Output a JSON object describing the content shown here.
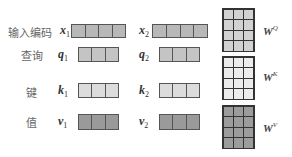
{
  "rows": [
    {
      "id": "input",
      "label": "输入编码",
      "var1": "x",
      "sub1": "1",
      "var2": "x",
      "sub2": "2",
      "cells": 4,
      "color": "#b8b8b8"
    },
    {
      "id": "query",
      "label": "查询",
      "var1": "q",
      "sub1": "1",
      "var2": "q",
      "sub2": "2",
      "cells": 3,
      "color": "#c4c4c4"
    },
    {
      "id": "key",
      "label": "键",
      "var1": "k",
      "sub1": "1",
      "var2": "k",
      "sub2": "2",
      "cells": 3,
      "color": "#dcdcdc"
    },
    {
      "id": "value",
      "label": "值",
      "var1": "v",
      "sub1": "1",
      "var2": "v",
      "sub2": "2",
      "cells": 3,
      "color": "#9a9a9a"
    }
  ],
  "matrices": [
    {
      "id": "wq",
      "base": "W",
      "sup": "Q",
      "rows": 4,
      "cols": 3,
      "color": "#d2d2d2"
    },
    {
      "id": "wk",
      "base": "W",
      "sup": "K",
      "rows": 4,
      "cols": 3,
      "color": "#ececec"
    },
    {
      "id": "wv",
      "base": "W",
      "sup": "V",
      "rows": 4,
      "cols": 3,
      "color": "#9c9c9c"
    }
  ]
}
